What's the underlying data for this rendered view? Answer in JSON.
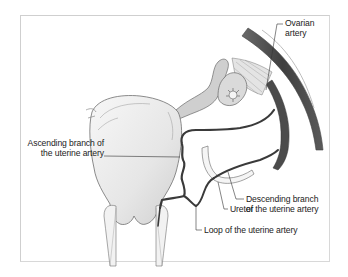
{
  "diagram": {
    "labels": {
      "ovarian_artery": [
        "Ovarian",
        "artery"
      ],
      "ascending_branch": [
        "Ascending branch of",
        "the uterine artery"
      ],
      "descending_branch": [
        "Descending branch",
        "of the uterine artery"
      ],
      "ureter": "Ureter",
      "loop": "Loop of the uterine artery"
    },
    "colors": {
      "artery": "#3a3a3a",
      "vessel": "#555555",
      "organ_fill": "#e9e9e9",
      "organ_outline": "#6e6e6e",
      "frame": "#cfcfcf",
      "leader_line": "#333333",
      "text": "#222222"
    }
  }
}
